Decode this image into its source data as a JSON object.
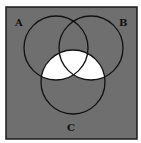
{
  "diagram": {
    "type": "venn-3-set",
    "sets": [
      {
        "label": "A",
        "cx": 56,
        "cy": 48,
        "r": 32,
        "label_x": 15,
        "label_y": 26
      },
      {
        "label": "B",
        "cx": 91,
        "cy": 48,
        "r": 32,
        "label_x": 119,
        "label_y": 26
      },
      {
        "label": "C",
        "cx": 73,
        "cy": 82,
        "r": 32,
        "label_x": 67,
        "label_y": 131
      }
    ],
    "shaded_region": "C ∩ (A ∪ B)",
    "colors": {
      "background": "#6f6f6f",
      "shaded": "#ffffff",
      "stroke": "#111111",
      "frame": "#1a1a1a"
    },
    "frame": {
      "x": 6,
      "y": 7,
      "width": 131,
      "height": 132
    }
  }
}
